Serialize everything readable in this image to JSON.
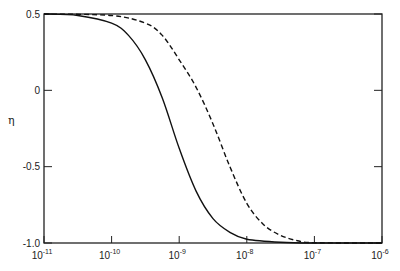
{
  "chart_data": {
    "type": "line",
    "title": "",
    "xlabel": "",
    "ylabel": "η",
    "xscale": "log",
    "xlim": [
      1e-11,
      1e-06
    ],
    "ylim": [
      -1.0,
      0.5
    ],
    "grid": false,
    "legend": null,
    "x_tick_labels": [
      {
        "base": "10",
        "exp": "-11"
      },
      {
        "base": "10",
        "exp": "-10"
      },
      {
        "base": "10",
        "exp": "-9"
      },
      {
        "base": "10",
        "exp": "-8"
      },
      {
        "base": "10",
        "exp": "-7"
      },
      {
        "base": "10",
        "exp": "-6"
      }
    ],
    "y_tick_labels": [
      "0.5",
      "0",
      "-0.5",
      "-1.0"
    ],
    "y_ticks": [
      0.5,
      0,
      -0.5,
      -1.0
    ],
    "series": [
      {
        "name": "solid",
        "style": "solid",
        "log10_x": [
          -11,
          -10.5,
          -10,
          -9.75,
          -9.5,
          -9.25,
          -9,
          -8.75,
          -8.5,
          -8.25,
          -8,
          -7.5,
          -7,
          -6
        ],
        "y": [
          0.5,
          0.49,
          0.44,
          0.36,
          0.2,
          -0.05,
          -0.38,
          -0.66,
          -0.84,
          -0.93,
          -0.975,
          -0.995,
          -1.0,
          -1.0
        ]
      },
      {
        "name": "dashed",
        "style": "dashed",
        "log10_x": [
          -11,
          -10,
          -9.5,
          -9.25,
          -9,
          -8.75,
          -8.5,
          -8.25,
          -8,
          -7.75,
          -7.5,
          -7.25,
          -7,
          -6
        ],
        "y": [
          0.5,
          0.49,
          0.44,
          0.36,
          0.2,
          0.02,
          -0.22,
          -0.5,
          -0.74,
          -0.88,
          -0.95,
          -0.985,
          -0.998,
          -1.0
        ]
      }
    ]
  }
}
